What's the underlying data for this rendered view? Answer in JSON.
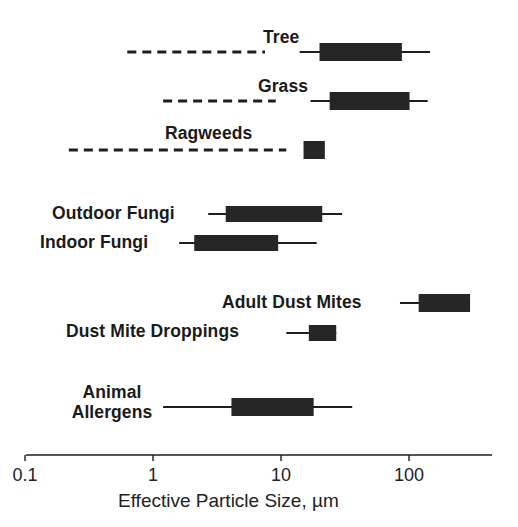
{
  "chart_data": {
    "type": "range",
    "title": "",
    "xlabel": "Effective Particle Size, µm",
    "ylabel": "",
    "xscale": "log",
    "xlim": [
      0.1,
      500
    ],
    "x_ticks": [
      0.1,
      1,
      10,
      100
    ],
    "x_tick_labels": [
      "0.1",
      "1",
      "10",
      "100"
    ],
    "grid": false,
    "legend": null,
    "encoding": {
      "box": "predominant particle size range (thick bar)",
      "line": "full particle size range (thin line)",
      "dashed": "fragment / sub-pollenic particle range (dashed line)"
    },
    "series": [
      {
        "name": "Tree",
        "label_lines": [
          "Tree"
        ],
        "dashed": [
          0.63,
          7.5
        ],
        "line": [
          14,
          146
        ],
        "box": [
          20,
          88
        ]
      },
      {
        "name": "Grass",
        "label_lines": [
          "Grass"
        ],
        "dashed": [
          1.2,
          9.1
        ],
        "line": [
          17,
          140
        ],
        "box": [
          24,
          101
        ]
      },
      {
        "name": "Ragweeds",
        "label_lines": [
          "Ragweeds"
        ],
        "dashed": [
          0.22,
          11
        ],
        "line": null,
        "box": [
          15,
          22
        ]
      },
      {
        "name": "Outdoor Fungi",
        "label_lines": [
          "Outdoor Fungi"
        ],
        "dashed": null,
        "line": [
          2.7,
          30
        ],
        "box": [
          3.7,
          21
        ]
      },
      {
        "name": "Indoor Fungi",
        "label_lines": [
          "Indoor Fungi"
        ],
        "dashed": null,
        "line": [
          1.6,
          19
        ],
        "box": [
          2.1,
          9.5
        ]
      },
      {
        "name": "Adult Dust Mites",
        "label_lines": [
          "Adult Dust Mites"
        ],
        "dashed": null,
        "line": [
          85,
          300
        ],
        "box": [
          119,
          300
        ]
      },
      {
        "name": "Dust Mite Droppings",
        "label_lines": [
          "Dust Mite Droppings"
        ],
        "dashed": null,
        "line": [
          11,
          27
        ],
        "box": [
          16.5,
          27
        ]
      },
      {
        "name": "Animal Allergens",
        "label_lines": [
          "Animal",
          "Allergens"
        ],
        "dashed": null,
        "line": [
          1.2,
          36
        ],
        "box": [
          4.1,
          18
        ]
      }
    ]
  },
  "layout": {
    "x_of_1": 153,
    "px_per_decade": 128,
    "axis_y": 455,
    "axis_x_start": 26,
    "axis_x_end": 492,
    "rows": [
      {
        "y": 52,
        "box_h": 18,
        "label": {
          "x": 263,
          "y": 29,
          "align": "left"
        }
      },
      {
        "y": 101,
        "box_h": 18,
        "label": {
          "x": 258,
          "y": 78,
          "align": "left"
        }
      },
      {
        "y": 150,
        "box_h": 18,
        "label": {
          "x": 165,
          "y": 125,
          "align": "left"
        }
      },
      {
        "y": 214,
        "box_h": 16,
        "label": {
          "x": 52,
          "y": 205,
          "align": "left"
        }
      },
      {
        "y": 243,
        "box_h": 16,
        "label": {
          "x": 40,
          "y": 234,
          "align": "left"
        }
      },
      {
        "y": 303,
        "box_h": 18,
        "label": {
          "x": 222,
          "y": 294,
          "align": "left"
        }
      },
      {
        "y": 333,
        "box_h": 16,
        "label": {
          "x": 66,
          "y": 323,
          "align": "left"
        }
      },
      {
        "y": 407,
        "box_h": 18,
        "label": {
          "x": 64,
          "y": 384,
          "align": "center",
          "w": 96
        }
      }
    ],
    "colors": {
      "ink": "#1e1e1e",
      "box": "#262626",
      "background": "#ffffff"
    }
  }
}
